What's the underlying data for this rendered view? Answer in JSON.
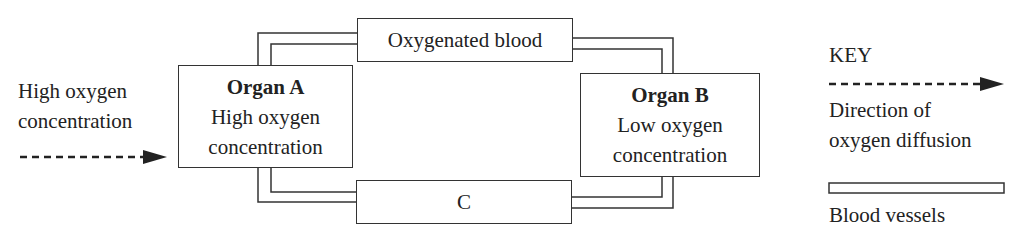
{
  "left_label": {
    "line1": "High oxygen",
    "line2": "concentration"
  },
  "organ_a": {
    "title": "Organ A",
    "line1": "High oxygen",
    "line2": "concentration"
  },
  "organ_b": {
    "title": "Organ B",
    "line1": "Low oxygen",
    "line2": "concentration"
  },
  "top_vessel": {
    "label": "Oxygenated blood"
  },
  "bottom_vessel": {
    "label": "C"
  },
  "key": {
    "title": "KEY",
    "arrow_label_line1": "Direction of",
    "arrow_label_line2": "oxygen diffusion",
    "vessel_label": "Blood vessels"
  },
  "icons": {
    "diffusion_arrow": "dashed-arrow-right",
    "blood_vessel": "double-line-bar"
  },
  "colors": {
    "line": "#333333",
    "text": "#222222",
    "background": "#ffffff"
  }
}
